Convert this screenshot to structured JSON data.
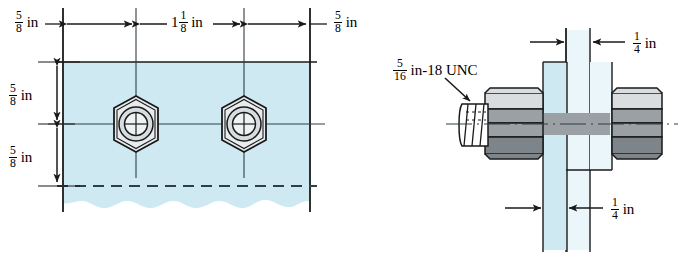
{
  "figure": {
    "colors": {
      "plate_fill": "#cfe9f2",
      "plate_fill_light": "#ddeff6",
      "nut_fill_light": "#d9dde0",
      "nut_fill_mid": "#9aa0a4",
      "nut_fill_dark": "#7e858a",
      "line": "#1a1a1a",
      "centerline": "#3a4a55",
      "background": "#ffffff"
    }
  },
  "front_view": {
    "name": "front-view",
    "dimensions": {
      "edge_left": {
        "whole": "",
        "num": "5",
        "den": "8",
        "unit": "in"
      },
      "bolt_spacing": {
        "whole": "1",
        "num": "1",
        "den": "8",
        "unit": "in"
      },
      "edge_right": {
        "whole": "",
        "num": "5",
        "den": "8",
        "unit": "in"
      },
      "edge_top": {
        "whole": "",
        "num": "5",
        "den": "8",
        "unit": "in"
      },
      "edge_bottom": {
        "whole": "",
        "num": "5",
        "den": "8",
        "unit": "in"
      }
    },
    "fasteners": [
      {
        "name": "hex-nut-left"
      },
      {
        "name": "hex-nut-right"
      }
    ]
  },
  "side_view": {
    "name": "side-view",
    "thread_callout": {
      "whole": "",
      "num": "5",
      "den": "16",
      "unit": "in-18 UNC"
    },
    "dimensions": {
      "plate_thickness_top": {
        "whole": "",
        "num": "1",
        "den": "4",
        "unit": "in"
      },
      "plate_thickness_bottom": {
        "whole": "",
        "num": "1",
        "den": "4",
        "unit": "in"
      }
    },
    "fasteners": [
      {
        "name": "hex-nut-near"
      },
      {
        "name": "hex-nut-far"
      }
    ]
  }
}
